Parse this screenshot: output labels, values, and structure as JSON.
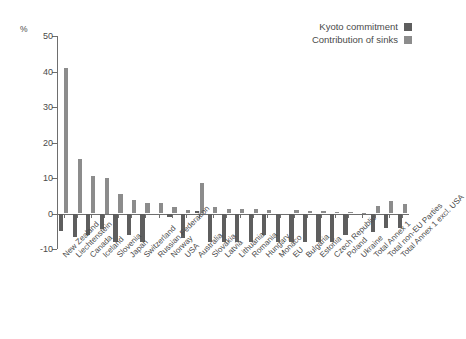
{
  "chart_data": {
    "type": "bar",
    "title": "",
    "subtitle": "",
    "xlabel": "",
    "ylabel": "%",
    "unit_label": "%",
    "ylim": [
      -10,
      50
    ],
    "yticks": [
      50,
      40,
      30,
      20,
      10,
      0,
      -10
    ],
    "grid": false,
    "legend_position": "top-right",
    "orientation": "vertical",
    "categories": [
      "New Zealand",
      "Liechtenstein",
      "Canada",
      "Iceland",
      "Slovenia",
      "Japan",
      "Switzerland",
      "Russian Federation",
      "Norway",
      "USA",
      "Australia",
      "Slovakia",
      "Latvia",
      "Lithuania",
      "Romania",
      "Hungary",
      "Monaco",
      "EU",
      "Bulgaria",
      "Estonia",
      "Czech Republic",
      "Poland",
      "Ukraine",
      "Total Annex 1",
      "Total non-EU Parties",
      "Total Annex 1 excl. USA"
    ],
    "series": [
      {
        "name": "Kyoto commitment",
        "color": "#5e5e5e",
        "values": [
          -5.0,
          -6.5,
          -6.0,
          -4.5,
          -8.0,
          -6.0,
          -8.0,
          0.0,
          -1.0,
          -7.0,
          0.8,
          -8.0,
          -8.0,
          -8.0,
          -8.0,
          -6.0,
          -8.0,
          -8.0,
          -8.0,
          -8.0,
          -8.0,
          -6.0,
          0.0,
          -5.2,
          -4.0,
          -4.2
        ]
      },
      {
        "name": "Contribution of sinks",
        "color": "#8c8c8c",
        "values": [
          41.0,
          15.3,
          10.5,
          10.0,
          5.6,
          3.8,
          2.9,
          2.9,
          1.8,
          1.0,
          8.6,
          1.8,
          1.4,
          1.4,
          1.3,
          1.0,
          0.0,
          0.9,
          0.7,
          0.6,
          0.5,
          0.4,
          0.2,
          2.2,
          3.4,
          2.8
        ]
      }
    ],
    "legend": [
      {
        "label": "Kyoto commitment",
        "color": "#5e5e5e"
      },
      {
        "label": "Contribution of sinks",
        "color": "#8c8c8c"
      }
    ]
  }
}
